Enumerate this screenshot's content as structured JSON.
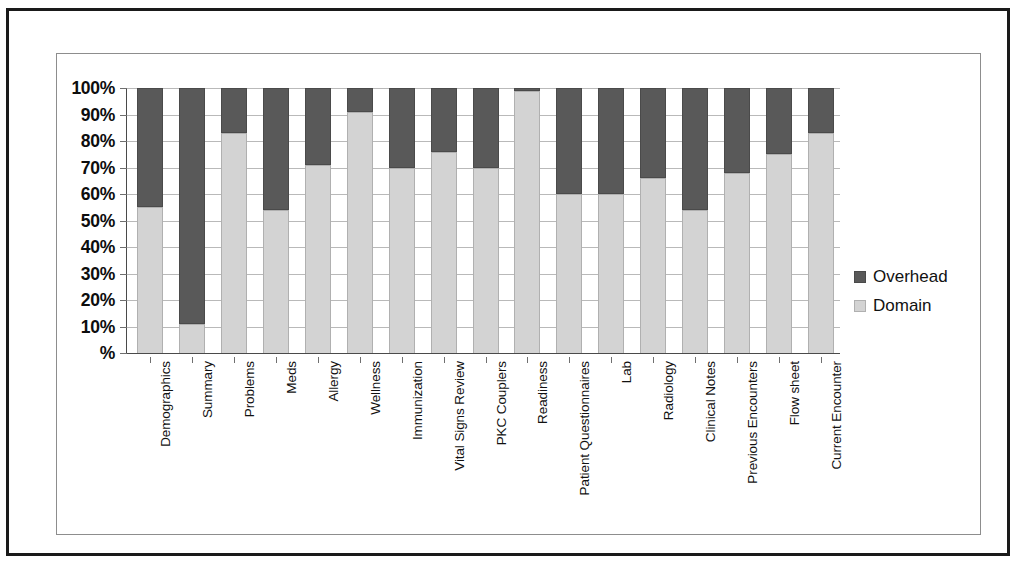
{
  "chart_data": {
    "type": "bar",
    "subtype": "stacked-100-percent",
    "title": "",
    "subtitle": "",
    "xlabel": "",
    "ylabel": "",
    "ylim": [
      0,
      100
    ],
    "grid": true,
    "legend_position": "right",
    "categories": [
      "Demographics",
      "Summary",
      "Problems",
      "Meds",
      "Allergy",
      "Wellness",
      "Immunization",
      "Vital Signs Review",
      "PKC Couplers",
      "Readiness",
      "Patient Questionnaires",
      "Lab",
      "Radiology",
      "Clinical Notes",
      "Previous Encounters",
      "Flow sheet",
      "Current Encounter"
    ],
    "series": [
      {
        "name": "Domain",
        "color": "#d3d3d3",
        "values": [
          55,
          11,
          83,
          54,
          71,
          91,
          70,
          76,
          70,
          99,
          60,
          60,
          66,
          54,
          68,
          75,
          83
        ]
      },
      {
        "name": "Overhead",
        "color": "#595959",
        "values": [
          45,
          89,
          17,
          46,
          29,
          9,
          30,
          24,
          30,
          1,
          40,
          40,
          34,
          46,
          32,
          25,
          17
        ]
      }
    ],
    "stack_order": [
      "Domain",
      "Overhead"
    ],
    "y_ticks": [
      0,
      10,
      20,
      30,
      40,
      50,
      60,
      70,
      80,
      90,
      100
    ],
    "y_tick_labels": [
      "%",
      "10%",
      "20%",
      "30%",
      "40%",
      "50%",
      "60%",
      "70%",
      "80%",
      "90%",
      "100%"
    ]
  },
  "legend": {
    "entries": [
      {
        "label": "Overhead",
        "color": "#595959"
      },
      {
        "label": "Domain",
        "color": "#d3d3d3"
      }
    ]
  }
}
